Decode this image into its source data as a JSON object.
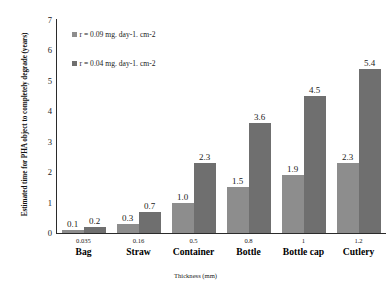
{
  "chart_data": {
    "type": "bar",
    "title": "",
    "xlabel": "Thickness (mm)",
    "ylabel": "Estimated time for PHA object to completely degrade (years)",
    "ylim": [
      0,
      7
    ],
    "yticks": [
      7,
      6,
      5,
      4,
      3,
      2,
      1,
      0
    ],
    "grid": false,
    "legend_position": "top-left",
    "categories": [
      "Bag",
      "Straw",
      "Container",
      "Bottle",
      "Bottle cap",
      "Cutlery"
    ],
    "thickness_mm": [
      "0.035",
      "0.16",
      "0.5",
      "0.8",
      "1",
      "1.2"
    ],
    "series": [
      {
        "name": "r = 0.09 mg. day-1. cm-2",
        "color": "#8d8d8d",
        "values": [
          0.1,
          0.3,
          1.0,
          1.5,
          1.9,
          2.3
        ],
        "labels": [
          "0.1",
          "0.3",
          "1.0",
          "1.5",
          "1.9",
          "2.3"
        ]
      },
      {
        "name": "r = 0.04 mg. day-1. cm-2",
        "color": "#6f6f6f",
        "values": [
          0.2,
          0.7,
          2.3,
          3.6,
          4.5,
          5.4
        ],
        "labels": [
          "0.2",
          "0.7",
          "2.3",
          "3.6",
          "4.5",
          "5.4"
        ]
      }
    ]
  }
}
